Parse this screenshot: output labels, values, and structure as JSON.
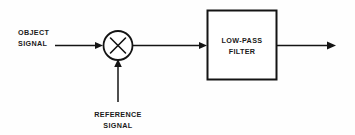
{
  "diagram": {
    "background_color": "#fefefe",
    "line_color": "#141414",
    "nodes": {
      "object_signal": {
        "label_line1": "OBJECT",
        "label_line2": "SIGNAL",
        "role": "input-signal"
      },
      "multiplier": {
        "symbol": "X",
        "shape": "circle",
        "role": "mixer-multiplier"
      },
      "reference_signal": {
        "label_line1": "REFERENCE",
        "label_line2": "SIGNAL",
        "role": "input-signal"
      },
      "filter": {
        "label_line1": "LOW-PASS",
        "label_line2": "FILTER",
        "shape": "rectangle",
        "role": "processing-block"
      },
      "output": {
        "label": "",
        "role": "output-signal"
      }
    },
    "connections": [
      {
        "from": "object_signal",
        "to": "multiplier",
        "direction": "right"
      },
      {
        "from": "reference_signal",
        "to": "multiplier",
        "direction": "up"
      },
      {
        "from": "multiplier",
        "to": "filter",
        "direction": "right"
      },
      {
        "from": "filter",
        "to": "output",
        "direction": "right"
      }
    ]
  }
}
